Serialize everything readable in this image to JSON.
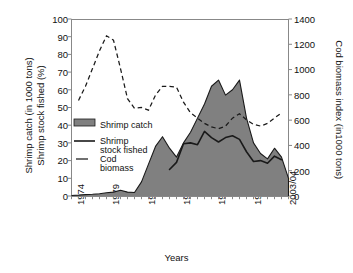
{
  "chart_data": {
    "type": "area",
    "title": "",
    "xlabel": "Years",
    "ylabel_left": "Shrimp catch (in 1000 tons) Shrimp stock fished (%)",
    "ylabel_left_line1": "Shrimp catch (in 1000 tons)",
    "ylabel_left_line2": "Shrimp stock fished (%)",
    "ylabel_right": "Cod biomass index (in1000 tons)",
    "grid": false,
    "legend_position": "inner-left",
    "ylim_left": [
      0,
      100
    ],
    "ylim_right": [
      0,
      1400
    ],
    "ytick_left": [
      "0",
      "10",
      "20",
      "30",
      "40",
      "50",
      "60",
      "70",
      "80",
      "90",
      "100"
    ],
    "ytick_right": [
      "0",
      "200",
      "400",
      "600",
      "800",
      "1000",
      "1200",
      "1400"
    ],
    "xtick_labels": [
      "1974",
      "1979",
      "1984",
      "1989",
      "1993/94",
      "1998/99",
      "2003/04"
    ],
    "xtick_positions": [
      0,
      5,
      10,
      15,
      20,
      25,
      30
    ],
    "x": [
      0,
      1,
      2,
      3,
      4,
      5,
      6,
      7,
      8,
      9,
      10,
      11,
      12,
      13,
      14,
      15,
      16,
      17,
      18,
      19,
      20,
      21,
      22,
      23,
      24,
      25,
      26,
      27,
      28,
      29,
      30,
      31
    ],
    "x_years": [
      "1974",
      "1975",
      "1976",
      "1977",
      "1978",
      "1979",
      "1980",
      "1981",
      "1982",
      "1983",
      "1984",
      "1985",
      "1986",
      "1987",
      "1988",
      "1989",
      "1990",
      "1991",
      "1992",
      "1993/94",
      "1994/95",
      "1995/96",
      "1996/97",
      "1997/98",
      "1998/99",
      "1999/00",
      "2000/01",
      "2001/02",
      "2002/03",
      "2003/04",
      "2004/05",
      "2005/06"
    ],
    "series": [
      {
        "name": "Shrimp catch",
        "style": "area-filled",
        "axis": "left",
        "units": "1000 tons",
        "color": "#808080",
        "edge_color": "#1a1a1a",
        "values": [
          0.3,
          0.5,
          0.8,
          1.0,
          1.3,
          1.8,
          2.2,
          3.2,
          2.2,
          2.0,
          8.0,
          18.0,
          28.0,
          33.5,
          27.0,
          22.0,
          30.0,
          36.0,
          44.0,
          52.0,
          62.0,
          65.5,
          57.0,
          60.0,
          65.5,
          44.0,
          30.0,
          24.0,
          21.0,
          27.0,
          22.0,
          10.0
        ]
      },
      {
        "name": "Shrimp stock fished",
        "style": "solid-line",
        "axis": "left",
        "units": "%",
        "color": "#1a1a1a",
        "values": [
          null,
          null,
          null,
          null,
          null,
          null,
          null,
          null,
          null,
          null,
          null,
          null,
          null,
          null,
          15.0,
          19.0,
          29.5,
          30.0,
          29.0,
          36.5,
          33.0,
          30.5,
          33.0,
          34.0,
          32.0,
          25.0,
          19.5,
          20.0,
          18.5,
          22.5,
          20.5,
          null
        ]
      },
      {
        "name": "Cod biomass",
        "style": "dashed-line",
        "axis": "right",
        "units": "index (1000 tons)",
        "color": "#1a1a1a",
        "values_left_scale": [
          null,
          54.0,
          62.0,
          72.0,
          82.0,
          90.5,
          88.0,
          72.0,
          55.0,
          49.5,
          50.0,
          48.5,
          57.0,
          62.0,
          62.0,
          61.5,
          53.0,
          47.0,
          44.0,
          41.0,
          39.0,
          38.0,
          39.5,
          44.0,
          46.5,
          43.0,
          40.5,
          39.5,
          41.0,
          44.0,
          47.0,
          null
        ],
        "values_right_scale": [
          null,
          756,
          868,
          1008,
          1148,
          1267,
          1232,
          1008,
          770,
          693,
          700,
          679,
          798,
          868,
          868,
          861,
          742,
          658,
          616,
          574,
          546,
          532,
          553,
          616,
          651,
          602,
          567,
          553,
          574,
          616,
          658,
          null
        ]
      }
    ],
    "legend": [
      {
        "label": "Shrimp catch",
        "marker": "filled-box",
        "color": "#808080"
      },
      {
        "label_line1": "Shrimp",
        "label_line2": "stock fished",
        "label": "Shrimp stock fished",
        "marker": "solid-line",
        "color": "#1a1a1a"
      },
      {
        "label_line1": "Cod",
        "label_line2": "biomass",
        "label": "Cod biomass",
        "marker": "dashed-line",
        "color": "#1a1a1a"
      }
    ]
  },
  "axes": {
    "xlabel": "Years",
    "ylabel_left_line1": "Shrimp catch (in 1000 tons)",
    "ylabel_left_line2": "Shrimp stock fished (%)",
    "ylabel_right": "Cod biomass index (in1000 tons)"
  },
  "ytick_left": {
    "t0": "0",
    "t1": "10",
    "t2": "20",
    "t3": "30",
    "t4": "40",
    "t5": "50",
    "t6": "60",
    "t7": "70",
    "t8": "80",
    "t9": "90",
    "t10": "100"
  },
  "ytick_right": {
    "t0": "0",
    "t1": "200",
    "t2": "400",
    "t3": "600",
    "t4": "800",
    "t5": "1000",
    "t6": "1200",
    "t7": "1400"
  },
  "xtick": {
    "t0": "1974",
    "t1": "1979",
    "t2": "1984",
    "t3": "1989",
    "t4": "1993/94",
    "t5": "1998/99",
    "t6": "2003/04"
  },
  "legend": {
    "shrimp_catch": "Shrimp catch",
    "shrimp_stock_l1": "Shrimp",
    "shrimp_stock_l2": "stock fished",
    "cod_l1": "Cod",
    "cod_l2": "biomass"
  }
}
